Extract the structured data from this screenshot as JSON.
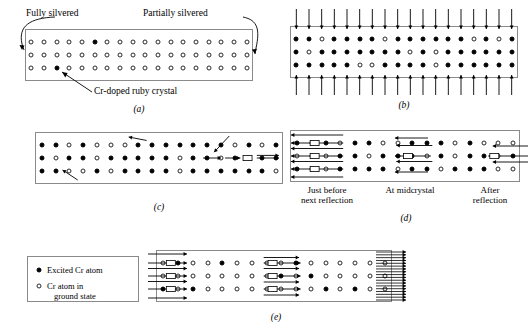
{
  "figure": {
    "line_color": "#000000",
    "crystal_border_color": "#8a8a8a"
  },
  "legend": {
    "excited_label": "Excited Cr atom",
    "ground_label_line1": "Cr atom in",
    "ground_label_line2": "ground state",
    "excited_icon": "filled-circle-icon",
    "ground_icon": "open-circle-icon"
  },
  "panels": [
    {
      "id": "a",
      "caption": "(a)",
      "labels": {
        "left_mirror": "Fully silvered",
        "right_mirror": "Partially silvered",
        "callout": "Cr-doped ruby crystal"
      },
      "columns": 18,
      "rows": 3,
      "excited_positions": [
        [
          0,
          5
        ],
        [
          2,
          2
        ]
      ],
      "description": "All Cr atoms in ground state except two excited"
    },
    {
      "id": "b",
      "caption": "(b)",
      "columns": 18,
      "rows": 3,
      "ground_positions": [
        [
          0,
          2
        ],
        [
          0,
          7
        ],
        [
          0,
          14
        ],
        [
          0,
          16
        ],
        [
          1,
          1
        ],
        [
          1,
          9
        ],
        [
          1,
          11
        ],
        [
          2,
          5
        ],
        [
          2,
          6
        ],
        [
          2,
          11
        ]
      ],
      "pump_arrows_top": 18,
      "pump_arrows_bottom": 18,
      "description": "Optical pumping produces population inversion"
    },
    {
      "id": "c",
      "caption": "(c)",
      "columns": 18,
      "rows": 3,
      "ground_positions": [
        [
          0,
          2
        ],
        [
          0,
          4
        ],
        [
          0,
          5
        ],
        [
          0,
          6
        ],
        [
          0,
          14
        ],
        [
          0,
          16
        ],
        [
          1,
          1
        ],
        [
          1,
          4
        ],
        [
          1,
          10
        ],
        [
          1,
          13
        ],
        [
          2,
          2
        ],
        [
          2,
          3
        ],
        [
          2,
          5
        ],
        [
          2,
          10
        ],
        [
          2,
          17
        ]
      ],
      "spontaneous_arrows": 3,
      "stimulated_chain_row": 1,
      "description": "Spontaneous emission starts stimulated emission chain"
    },
    {
      "id": "d",
      "caption": "(d)",
      "columns": 16,
      "rows": 3,
      "labels": {
        "left": "Just before\nnext reflection",
        "left_line1": "Just before",
        "left_line2": "next reflection",
        "middle": "At midcrystal",
        "right_line1": "After",
        "right_line2": "reflection"
      },
      "beam_direction": "leftward",
      "description": "Beam travels left, reflects off fully silvered end"
    },
    {
      "id": "e",
      "caption": "(e)",
      "columns": 16,
      "rows": 3,
      "beam_direction": "rightward",
      "output_beam": true,
      "description": "Amplified beam exits through partially silvered end as laser output"
    }
  ]
}
